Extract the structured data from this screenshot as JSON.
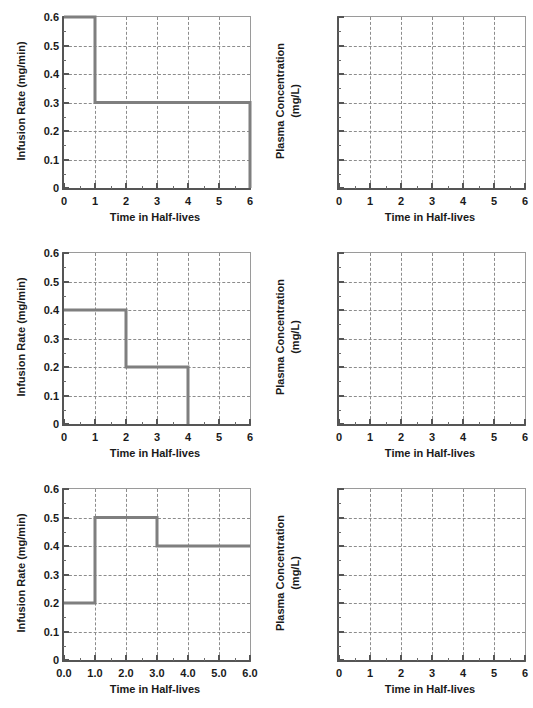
{
  "figure": {
    "width": 533,
    "height": 708,
    "line_color": "#7f7f7f",
    "axis_color": "#555555",
    "grid_color": "#8c8c8c"
  },
  "axis_titles": {
    "x": "Time in Half-lives",
    "y_infusion": "Infusion Rate (mg/min)",
    "y_plasma_line1": "Plasma Concentration",
    "y_plasma_line2": "(mg/L)"
  },
  "x_ticks_integer": [
    "0",
    "1",
    "2",
    "3",
    "4",
    "5",
    "6"
  ],
  "x_ticks_decimal": [
    "0.0",
    "1.0",
    "2.0",
    "3.0",
    "4.0",
    "5.0",
    "6.0"
  ],
  "y_ticks_infusion": [
    "0.6",
    "0.5",
    "0.4",
    "0.3",
    "0.2",
    "0.1",
    "0"
  ],
  "chart_data": [
    {
      "id": "panel-1-infusion",
      "type": "line",
      "title": "",
      "xlabel": "Time in Half-lives",
      "ylabel": "Infusion Rate (mg/min)",
      "xlim": [
        0,
        6
      ],
      "ylim": [
        0,
        0.6
      ],
      "xticks": [
        0,
        1,
        2,
        3,
        4,
        5,
        6
      ],
      "xticklabels": [
        "0",
        "1",
        "2",
        "3",
        "4",
        "5",
        "6"
      ],
      "yticks": [
        0,
        0.1,
        0.2,
        0.3,
        0.4,
        0.5,
        0.6
      ],
      "yticklabels": [
        "0",
        "0.1",
        "0.2",
        "0.3",
        "0.4",
        "0.5",
        "0.6"
      ],
      "grid": true,
      "legend": null,
      "step_segments": [
        {
          "x_start": 0,
          "x_end": 1,
          "y": 0.6
        },
        {
          "x_start": 1,
          "x_end": 6,
          "y": 0.3
        }
      ],
      "x": [
        0,
        1,
        1,
        6,
        6
      ],
      "y": [
        0.6,
        0.6,
        0.3,
        0.3,
        0
      ]
    },
    {
      "id": "panel-1-plasma",
      "type": "line",
      "title": "",
      "xlabel": "Time in Half-lives",
      "ylabel": "Plasma Concentration (mg/L)",
      "xlim": [
        0,
        6
      ],
      "ylim": [
        0,
        6
      ],
      "xticks": [
        0,
        1,
        2,
        3,
        4,
        5,
        6
      ],
      "xticklabels": [
        "0",
        "1",
        "2",
        "3",
        "4",
        "5",
        "6"
      ],
      "yticks": [],
      "yticklabels": [],
      "grid": true,
      "legend": null,
      "x": [],
      "y": []
    },
    {
      "id": "panel-2-infusion",
      "type": "line",
      "title": "",
      "xlabel": "Time in Half-lives",
      "ylabel": "Infusion Rate (mg/min)",
      "xlim": [
        0,
        6
      ],
      "ylim": [
        0,
        0.6
      ],
      "xticks": [
        0,
        1,
        2,
        3,
        4,
        5,
        6
      ],
      "xticklabels": [
        "0",
        "1",
        "2",
        "3",
        "4",
        "5",
        "6"
      ],
      "yticks": [
        0,
        0.1,
        0.2,
        0.3,
        0.4,
        0.5,
        0.6
      ],
      "yticklabels": [
        "0",
        "0.1",
        "0.2",
        "0.3",
        "0.4",
        "0.5",
        "0.6"
      ],
      "grid": true,
      "legend": null,
      "step_segments": [
        {
          "x_start": 0,
          "x_end": 2,
          "y": 0.4
        },
        {
          "x_start": 2,
          "x_end": 4,
          "y": 0.2
        }
      ],
      "x": [
        0,
        2,
        2,
        4,
        4
      ],
      "y": [
        0.4,
        0.4,
        0.2,
        0.2,
        0
      ]
    },
    {
      "id": "panel-2-plasma",
      "type": "line",
      "title": "",
      "xlabel": "Time in Half-lives",
      "ylabel": "Plasma Concentration (mg/L)",
      "xlim": [
        0,
        6
      ],
      "ylim": [
        0,
        6
      ],
      "xticks": [
        0,
        1,
        2,
        3,
        4,
        5,
        6
      ],
      "xticklabels": [
        "0",
        "1",
        "2",
        "3",
        "4",
        "5",
        "6"
      ],
      "yticks": [],
      "yticklabels": [],
      "grid": true,
      "legend": null,
      "x": [],
      "y": []
    },
    {
      "id": "panel-3-infusion",
      "type": "line",
      "title": "",
      "xlabel": "Time in Half-lives",
      "ylabel": "Infusion Rate (mg/min)",
      "xlim": [
        0,
        6
      ],
      "ylim": [
        0,
        0.6
      ],
      "xticks": [
        0,
        1,
        2,
        3,
        4,
        5,
        6
      ],
      "xticklabels": [
        "0.0",
        "1.0",
        "2.0",
        "3.0",
        "4.0",
        "5.0",
        "6.0"
      ],
      "yticks": [
        0,
        0.1,
        0.2,
        0.3,
        0.4,
        0.5,
        0.6
      ],
      "yticklabels": [
        "0",
        "0.1",
        "0.2",
        "0.3",
        "0.4",
        "0.5",
        "0.6"
      ],
      "grid": true,
      "legend": null,
      "step_segments": [
        {
          "x_start": 0,
          "x_end": 1,
          "y": 0.2
        },
        {
          "x_start": 1,
          "x_end": 3,
          "y": 0.5
        },
        {
          "x_start": 3,
          "x_end": 6,
          "y": 0.4
        }
      ],
      "x": [
        0,
        1,
        1,
        3,
        3,
        6
      ],
      "y": [
        0.2,
        0.2,
        0.5,
        0.5,
        0.4,
        0.4
      ]
    },
    {
      "id": "panel-3-plasma",
      "type": "line",
      "title": "",
      "xlabel": "Time in Half-lives",
      "ylabel": "Plasma Concentration (mg/L)",
      "xlim": [
        0,
        6
      ],
      "ylim": [
        0,
        6
      ],
      "xticks": [
        0,
        1,
        2,
        3,
        4,
        5,
        6
      ],
      "xticklabels": [
        "0",
        "1",
        "2",
        "3",
        "4",
        "5",
        "6"
      ],
      "yticks": [],
      "yticklabels": [],
      "grid": true,
      "legend": null,
      "x": [],
      "y": []
    }
  ]
}
